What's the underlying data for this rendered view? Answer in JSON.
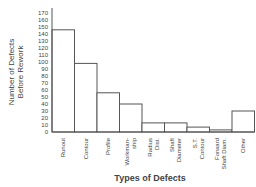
{
  "chart_data": {
    "type": "bar",
    "title": "",
    "xlabel": "Types of Defects",
    "ylabel": [
      "Number of Defects",
      "Before Rework"
    ],
    "ylim": [
      0,
      170
    ],
    "yticks": [
      0,
      10,
      20,
      30,
      40,
      50,
      60,
      70,
      80,
      90,
      100,
      110,
      120,
      130,
      140,
      150,
      160,
      170
    ],
    "grid": false,
    "legend": null,
    "categories": [
      [
        "Runout"
      ],
      [
        "Contour"
      ],
      [
        "Profile"
      ],
      [
        "Workman-",
        "ship"
      ],
      [
        "Radius",
        "Dist."
      ],
      [
        "Shaft",
        "Diameter"
      ],
      [
        "S.T.",
        "Contour"
      ],
      [
        "Forward",
        "Shaft Diam."
      ],
      [
        "Other"
      ]
    ],
    "values": [
      146,
      98,
      56,
      40,
      13,
      13,
      7,
      3,
      30
    ],
    "colors": {
      "bar_fill": "#ffffff",
      "bar_stroke": "#555555",
      "axis": "#555555",
      "text": "#444444"
    }
  }
}
